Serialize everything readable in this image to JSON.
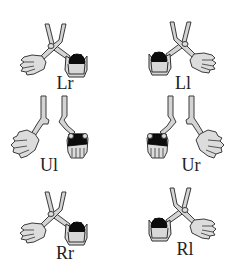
{
  "figure": {
    "panels": [
      {
        "id": "Lr",
        "label": "Lr",
        "row": 0,
        "col": 0,
        "type": "crossed",
        "ball_side": "right"
      },
      {
        "id": "Ll",
        "label": "Ll",
        "row": 0,
        "col": 1,
        "type": "crossed",
        "ball_side": "left"
      },
      {
        "id": "Ul",
        "label": "Ul",
        "row": 1,
        "col": 0,
        "type": "uncrossed",
        "ball_side": "right"
      },
      {
        "id": "Ur",
        "label": "Ur",
        "row": 1,
        "col": 1,
        "type": "uncrossed",
        "ball_side": "left"
      },
      {
        "id": "Rr",
        "label": "Rr",
        "row": 2,
        "col": 0,
        "type": "crossed",
        "ball_side": "right"
      },
      {
        "id": "Rl",
        "label": "Rl",
        "row": 2,
        "col": 1,
        "type": "crossed",
        "ball_side": "left"
      }
    ],
    "colors": {
      "background": "#ffffff",
      "hand_fill": "#dcdcdc",
      "outline": "#3a3a3a",
      "ball": "#0c0c0c",
      "label_text": "#222222"
    }
  }
}
